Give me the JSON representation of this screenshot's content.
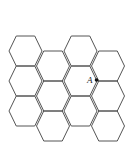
{
  "diagram": {
    "type": "hexagonal-grid",
    "orientation": "flat-top",
    "stroke_color": "#555555",
    "background": "#ffffff",
    "hex_radius": 16.5,
    "hex_half_height": 15,
    "hexagons": [
      {
        "col": 0,
        "cx": 25.5,
        "cy": 51
      },
      {
        "col": 0,
        "cx": 25.5,
        "cy": 81
      },
      {
        "col": 0,
        "cx": 25.5,
        "cy": 111
      },
      {
        "col": 1,
        "cx": 53,
        "cy": 66
      },
      {
        "col": 1,
        "cx": 53,
        "cy": 96
      },
      {
        "col": 1,
        "cx": 53,
        "cy": 126
      },
      {
        "col": 2,
        "cx": 80.5,
        "cy": 51
      },
      {
        "col": 2,
        "cx": 80.5,
        "cy": 81
      },
      {
        "col": 2,
        "cx": 80.5,
        "cy": 111
      },
      {
        "col": 3,
        "cx": 108,
        "cy": 66
      },
      {
        "col": 3,
        "cx": 108,
        "cy": 96
      },
      {
        "col": 3,
        "cx": 108,
        "cy": 126
      }
    ],
    "point": {
      "label": "A",
      "x": 96.5,
      "y": 80,
      "label_x": 87,
      "label_y": 83
    }
  }
}
